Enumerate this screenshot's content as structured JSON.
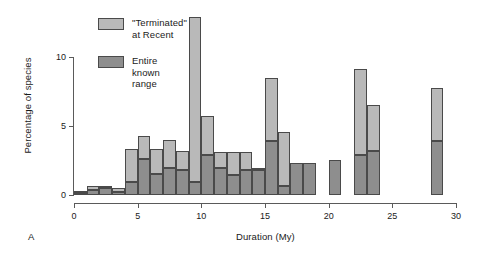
{
  "figure": {
    "panel_letter": "A"
  },
  "legend": {
    "position": "top-left-inside",
    "entries": [
      {
        "label": "\"Terminated\"\nat Recent",
        "color": "#b9b9b9",
        "swatch_name": "terminated-at-recent-swatch"
      },
      {
        "label": "Entire known\nrange",
        "color": "#8e8e8e",
        "swatch_name": "entire-known-range-swatch"
      }
    ]
  },
  "chart_data": {
    "type": "bar",
    "subtype": "stacked-histogram",
    "title": "",
    "xlabel": "Duration (My)",
    "ylabel": "Percentage of species",
    "xlim": [
      0,
      30
    ],
    "ylim": [
      0,
      13.5
    ],
    "xticks": [
      0,
      5,
      10,
      15,
      20,
      25,
      30
    ],
    "xtick_labels": [
      "0",
      "5",
      "10",
      "15",
      "20",
      "25",
      "30"
    ],
    "yticks": [
      0,
      5,
      10
    ],
    "ytick_labels": [
      "0",
      "5",
      "10"
    ],
    "grid": false,
    "bin_width": 1,
    "bin_starts": [
      0,
      1,
      2,
      3,
      4,
      5,
      6,
      7,
      8,
      9,
      10,
      11,
      12,
      13,
      14,
      15,
      16,
      17,
      18,
      19,
      20,
      21,
      22,
      23,
      24,
      25,
      26,
      27,
      28,
      29
    ],
    "series": [
      {
        "name": "Entire known range",
        "color": "#8e8e8e",
        "values": [
          0.15,
          0.35,
          0.55,
          0.25,
          1.0,
          2.7,
          1.6,
          2.0,
          1.9,
          1.0,
          3.0,
          2.0,
          1.5,
          1.9,
          1.9,
          4.0,
          0.7,
          2.4,
          2.4,
          0.0,
          2.6,
          0.0,
          3.0,
          3.3,
          0.0,
          0.0,
          0.0,
          0.0,
          4.0,
          0.0
        ]
      },
      {
        "name": "\"Terminated\" at Recent",
        "color": "#b9b9b9",
        "values": [
          0.05,
          0.3,
          0.15,
          0.25,
          2.4,
          1.7,
          1.8,
          2.1,
          1.4,
          12.3,
          2.9,
          1.2,
          1.7,
          1.3,
          0.1,
          4.7,
          4.0,
          0.0,
          0.0,
          0.0,
          0.0,
          0.0,
          6.4,
          3.4,
          0.0,
          0.0,
          0.0,
          0.0,
          4.0,
          0.0
        ]
      }
    ],
    "totals": [
      0.2,
      0.65,
      0.7,
      0.5,
      3.4,
      4.4,
      3.4,
      4.1,
      3.3,
      13.3,
      5.9,
      3.2,
      3.2,
      3.2,
      2.0,
      8.7,
      4.7,
      2.4,
      2.4,
      0.0,
      2.6,
      0.0,
      9.4,
      6.7,
      0.0,
      0.0,
      0.0,
      0.0,
      8.0,
      0.0
    ],
    "stack_order": [
      "Entire known range",
      "\"Terminated\" at Recent"
    ]
  }
}
